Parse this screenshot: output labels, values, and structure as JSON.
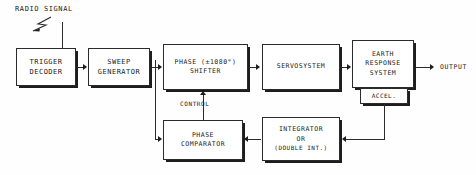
{
  "diagram": {
    "title_label": "RADIO SIGNAL",
    "output_label": "OUTPUT",
    "control_label": "CONTROL",
    "line_color": "#2b2b2b",
    "background": "#fefefe",
    "blocks": {
      "trigger_decoder": {
        "line1": "TRIGGER",
        "line2": "DECODER"
      },
      "sweep_generator": {
        "line1": "SWEEP",
        "line2": "GENERATOR"
      },
      "phase_shifter": {
        "line1": "PHASE (±1080°)",
        "line2": "SHIFTER"
      },
      "servosystem": {
        "line1": "SERVOSYSTEM"
      },
      "earth_response": {
        "line1": "EARTH",
        "line2": "RESPONSE",
        "line3": "SYSTEM"
      },
      "accelerometer": {
        "line1": "ACCEL."
      },
      "phase_comparator": {
        "line1": "PHASE",
        "line2": "COMPARATOR"
      },
      "integrator": {
        "line1": "INTEGRATOR",
        "line2": "OR",
        "line3": "(DOUBLE INT.)"
      }
    },
    "signal_flow": [
      "radio-signal → trigger-decoder",
      "trigger-decoder → sweep-generator",
      "sweep-generator → phase-shifter",
      "sweep-generator → phase-comparator",
      "phase-shifter → servosystem",
      "servosystem → earth-response-system",
      "earth-response-system → output",
      "accelerometer → integrator",
      "integrator → phase-comparator",
      "phase-comparator → phase-shifter (control)"
    ]
  }
}
